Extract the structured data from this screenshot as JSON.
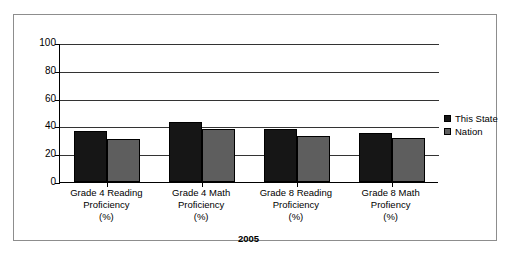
{
  "chart_data": {
    "type": "bar",
    "title": "",
    "subtitle": "",
    "xlabel": "2005",
    "ylabel": "",
    "ylim": [
      0,
      100
    ],
    "ytick_labels": [
      "0",
      "20",
      "40",
      "60",
      "80",
      "100"
    ],
    "ytick_values": [
      0,
      20,
      40,
      60,
      80,
      100
    ],
    "grid": true,
    "legend_position": "right",
    "categories": [
      "Grade 4 Reading\nProficiency\n(%)",
      "Grade 4 Math\nProficiency\n(%)",
      "Grade 8 Reading\nProficiency\n(%)",
      "Grade 8 Math\nProfiency\n(%)"
    ],
    "series": [
      {
        "name": "This State",
        "color": "#161616",
        "values": [
          37,
          43,
          38,
          35
        ]
      },
      {
        "name": "Nation",
        "color": "#5e5e5e",
        "values": [
          31,
          38,
          33,
          32
        ]
      }
    ]
  },
  "legend": {
    "items": [
      {
        "label": "This State",
        "color": "#161616"
      },
      {
        "label": "Nation",
        "color": "#5e5e5e"
      }
    ]
  },
  "colors": {
    "this_state": "#161616",
    "nation": "#5e5e5e",
    "axis": "#000000",
    "gridline": "#333333",
    "frame": "#8d8d8d",
    "background": "#ffffff"
  }
}
